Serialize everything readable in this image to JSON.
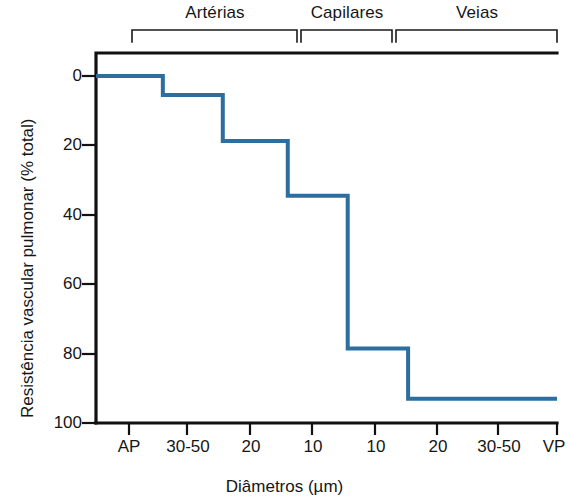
{
  "chart_data": {
    "type": "line",
    "subtype": "step",
    "title": "",
    "xlabel": "Diâmetros (µm)",
    "ylabel": "Resistência vascular pulmonar (% total)",
    "xticklabels": [
      "AP",
      "30-50",
      "20",
      "10",
      "10",
      "20",
      "30-50",
      "VP"
    ],
    "yticklabels": [
      "0",
      "20",
      "40",
      "60",
      "80",
      "100"
    ],
    "ytickvalues": [
      0,
      20,
      40,
      60,
      80,
      100
    ],
    "ylim": [
      100,
      0
    ],
    "y_axis_inverted": true,
    "grid": false,
    "legend": null,
    "line_color": "#2d6e9e",
    "line_width_px": 4,
    "series": [
      {
        "name": "Resistência vascular pulmonar",
        "steps": [
          {
            "x_start": 0.0,
            "x_end": 14.5,
            "value": 0.0
          },
          {
            "x_start": 14.5,
            "x_end": 27.5,
            "value": 5.5
          },
          {
            "x_start": 27.5,
            "x_end": 41.6,
            "value": 18.7
          },
          {
            "x_start": 41.6,
            "x_end": 54.6,
            "value": 34.5
          },
          {
            "x_start": 54.6,
            "x_end": 67.7,
            "value": 78.5
          },
          {
            "x_start": 67.7,
            "x_end": 100.0,
            "value": 93.0
          }
        ],
        "values": [
          0.0,
          5.5,
          18.7,
          34.5,
          78.5,
          93.0
        ]
      }
    ],
    "annotations": [
      {
        "label": "Artérias",
        "x_start": 7.8,
        "x_end": 43.6
      },
      {
        "label": "Capilares",
        "x_start": 44.5,
        "x_end": 64.2
      },
      {
        "label": "Veias",
        "x_start": 65.1,
        "x_end": 100.0
      }
    ]
  },
  "groups": [
    {
      "label": "Artérias"
    },
    {
      "label": "Capilares"
    },
    {
      "label": "Veias"
    }
  ],
  "xticks": [
    {
      "label": "AP"
    },
    {
      "label": "30-50"
    },
    {
      "label": "20"
    },
    {
      "label": "10"
    },
    {
      "label": "10"
    },
    {
      "label": "20"
    },
    {
      "label": "30-50"
    },
    {
      "label": "VP"
    }
  ],
  "yticks": [
    {
      "label": "0"
    },
    {
      "label": "20"
    },
    {
      "label": "40"
    },
    {
      "label": "60"
    },
    {
      "label": "80"
    },
    {
      "label": "100"
    }
  ],
  "axes": {
    "x_title": "Diâmetros (µm)",
    "y_title": "Resistência vascular pulmonar (% total)"
  }
}
